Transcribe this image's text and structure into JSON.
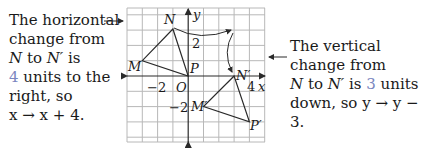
{
  "left_note": {
    "line1": "The horizontal",
    "line2": "change from",
    "line3_a": "N",
    "line3_b": " to ",
    "line3_c": "N′",
    "line3_d": " is",
    "line4_num": "4",
    "line4_rest": " units to the",
    "line5": "right, so",
    "line6": "x → x + 4."
  },
  "right_note": {
    "line1": "The vertical",
    "line2": "change from",
    "line3_a": "N",
    "line3_b": " to ",
    "line3_c": "N′",
    "line3_d": " is ",
    "line3_num": "3",
    "line3_e": " units",
    "line4": "down, so y → y − 3."
  },
  "graph": {
    "x_label": "x",
    "y_label": "y",
    "origin_label": "O",
    "tick_x_neg": "−2",
    "tick_x_pos": "4",
    "tick_y_pos": "2",
    "tick_y_neg": "−2",
    "points": {
      "M": "M",
      "N": "N",
      "P": "P",
      "M_prime": "M′",
      "N_prime": "N′",
      "P_prime": "P′"
    }
  },
  "colors": {
    "accent": "#7a86c0",
    "grid": "#b8b8b8",
    "line": "#2a2a2a"
  }
}
